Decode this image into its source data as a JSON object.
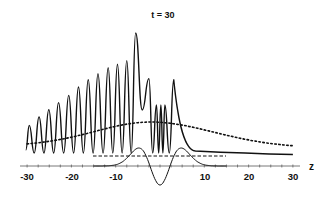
{
  "chart_data": {
    "type": "line",
    "title": "t = 30",
    "xlabel": "z",
    "ylabel": "",
    "xlim": [
      -30,
      30
    ],
    "xticks": [
      -30,
      -20,
      -10,
      10,
      20,
      30
    ],
    "xtick_labels": [
      "-30",
      "-20",
      "-10",
      "10",
      "20",
      "30"
    ],
    "grid": false,
    "legend": null,
    "series": [
      {
        "name": "oscillating wave (solid)",
        "style": "solid",
        "description": "Growing oscillations from z=-30 to about z=-8 (about 13 peaks, amplitude increasing), tallest peak near z=-5.5, secondary peak near z=-2.5, three small rapid spikes near z=-1 to 1, peak near z=3, then a decaying tail flattening toward z=30",
        "peaks": [
          {
            "z": -29.5,
            "rel_height": 0.23
          },
          {
            "z": -27.3,
            "rel_height": 0.3
          },
          {
            "z": -25.1,
            "rel_height": 0.36
          },
          {
            "z": -22.9,
            "rel_height": 0.42
          },
          {
            "z": -20.6,
            "rel_height": 0.48
          },
          {
            "z": -18.4,
            "rel_height": 0.55
          },
          {
            "z": -16.2,
            "rel_height": 0.61
          },
          {
            "z": -14.0,
            "rel_height": 0.66
          },
          {
            "z": -11.7,
            "rel_height": 0.71
          },
          {
            "z": -9.6,
            "rel_height": 0.74
          },
          {
            "z": -7.5,
            "rel_height": 0.77
          },
          {
            "z": -5.5,
            "rel_height": 1.0
          },
          {
            "z": -2.5,
            "rel_height": 0.62
          },
          {
            "z": -0.8,
            "rel_height": 0.4
          },
          {
            "z": 0.2,
            "rel_height": 0.4
          },
          {
            "z": 1.1,
            "rel_height": 0.4
          },
          {
            "z": 3.1,
            "rel_height": 0.61
          }
        ]
      },
      {
        "name": "envelope (dotted)",
        "style": "dotted",
        "description": "Broad smooth hump rising from z=-30, maximum near z=-2, slowly decaying to z=30"
      },
      {
        "name": "reference level (dashed)",
        "style": "dashed",
        "description": "Horizontal dashed line from about z=-15 to z=15"
      },
      {
        "name": "localized wavelet (solid, thin)",
        "style": "solid",
        "description": "Antisymmetric-looking wave packet centered at z=0: positive bumps near z=-4 and z=4, deep negative trough at z=0, zero outside about |z|>8"
      }
    ]
  }
}
